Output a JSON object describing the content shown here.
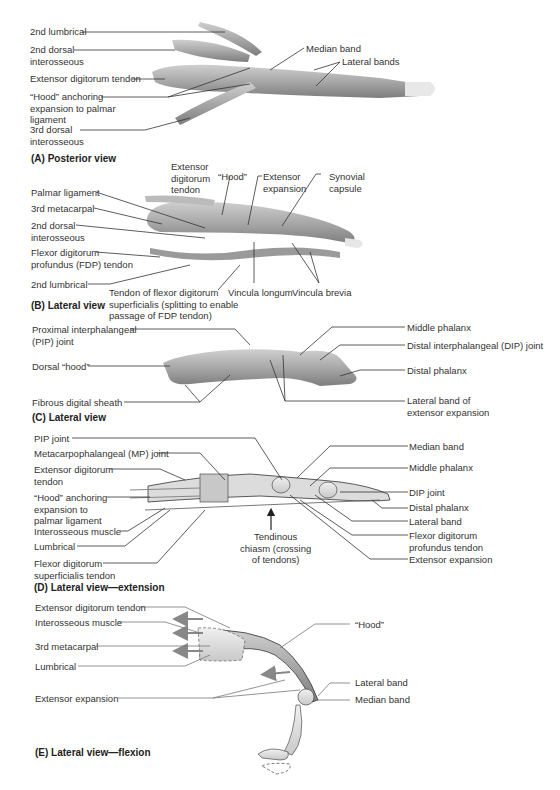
{
  "figure": {
    "panels": [
      {
        "id": "A",
        "caption": "(A) Posterior view",
        "labels": {
          "lumbrical_2": "2nd lumbrical",
          "dorsal_interosseous_2": "2nd dorsal\ninterosseous",
          "extensor_digitorum_tendon": "Extensor digitorum tendon",
          "hood_anchoring": "“Hood” anchoring\nexpansion to palmar\nligament",
          "dorsal_interosseous_3": "3rd dorsal\ninterosseous",
          "median_band": "Median band",
          "lateral_bands": "Lateral bands"
        }
      },
      {
        "id": "B",
        "caption": "(B) Lateral view",
        "labels": {
          "extensor_digitorum_tendon": "Extensor\ndigitorum\ntendon",
          "hood": "“Hood”",
          "extensor_expansion": "Extensor\nexpansion",
          "synovial_capsule": "Synovial\ncapsule",
          "palmar_ligament": "Palmar ligament",
          "metacarpal_3": "3rd metacarpal",
          "dorsal_interosseous_2": "2nd dorsal\ninterosseous",
          "fdp_tendon": "Flexor digitorum\nprofundus (FDP) tendon",
          "lumbrical_2": "2nd lumbrical",
          "fds_tendon": "Tendon of flexor digitorum\nsuperficialis (splitting to enable\npassage of FDP tendon)",
          "vincula_longum": "Vincula longum",
          "vincula_brevia": "Vincula brevia"
        }
      },
      {
        "id": "C",
        "caption": "(C) Lateral view",
        "labels": {
          "pip_joint": "Proximal interphalangeal\n(PIP) joint",
          "dorsal_hood": "Dorsal “hood”",
          "fibrous_sheath": "Fibrous digital sheath",
          "middle_phalanx": "Middle phalanx",
          "dip_joint": "Distal interphalangeal (DIP) joint",
          "distal_phalanx": "Distal phalanx",
          "lateral_band": "Lateral band of\nextensor expansion"
        }
      },
      {
        "id": "D",
        "caption": "(D) Lateral view—extension",
        "labels": {
          "pip_joint": "PIP joint",
          "mp_joint": "Metacarpophalangeal (MP) joint",
          "extensor_digitorum_tendon": "Extensor digitorum\ntendon",
          "hood_anchoring": "“Hood” anchoring\nexpansion to\npalmar ligament",
          "interosseous_muscle": "Interosseous muscle",
          "lumbrical": "Lumbrical",
          "fds_tendon": "Flexor digitorum\nsuperficialis tendon",
          "tendinous_chiasm": "Tendinous\nchiasm (crossing\nof tendons)",
          "median_band": "Median band",
          "middle_phalanx": "Middle phalanx",
          "dip_joint": "DIP joint",
          "distal_phalanx": "Distal phalanx",
          "lateral_band": "Lateral band",
          "fdp_tendon": "Flexor digitorum\nprofundus tendon",
          "extensor_expansion": "Extensor expansion"
        }
      },
      {
        "id": "E",
        "caption": "(E) Lateral view—flexion",
        "labels": {
          "extensor_digitorum_tendon": "Extensor digitorum tendon",
          "interosseous_muscle": "Interosseous muscle",
          "metacarpal_3": "3rd metacarpal",
          "lumbrical": "Lumbrical",
          "extensor_expansion": "Extensor expansion",
          "hood": "“Hood”",
          "lateral_band": "Lateral band",
          "median_band": "Median band"
        }
      }
    ]
  }
}
